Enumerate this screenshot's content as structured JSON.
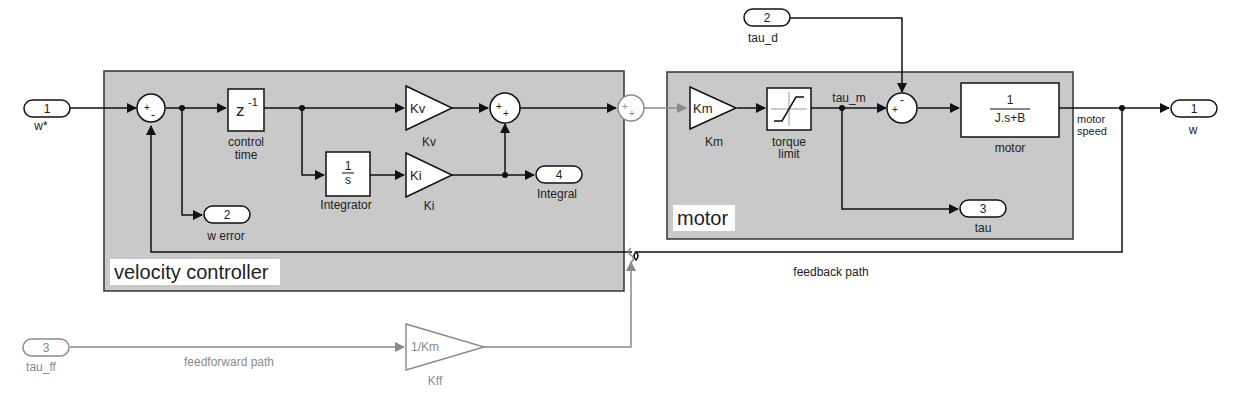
{
  "subsystems": {
    "velocity_controller": {
      "label": "velocity controller"
    },
    "motor": {
      "label": "motor"
    }
  },
  "inports": [
    {
      "num": "1",
      "label": "w*"
    },
    {
      "num": "2",
      "label": "tau_d"
    },
    {
      "num": "3",
      "label": "tau_ff"
    }
  ],
  "outports": [
    {
      "num": "1",
      "label": "w"
    },
    {
      "num": "2",
      "label": "w error"
    },
    {
      "num": "3",
      "label": "tau"
    },
    {
      "num": "4",
      "label": "Integral"
    }
  ],
  "blocks": {
    "delay": {
      "text": "z",
      "sup": "-1",
      "label1": "control",
      "label2": "time"
    },
    "integrator": {
      "num": "1",
      "den": "s",
      "label": "Integrator"
    },
    "kv": {
      "text": "Kv",
      "label": "Kv"
    },
    "ki": {
      "text": "Ki",
      "label": "Ki"
    },
    "km": {
      "text": "Km",
      "label": "Km"
    },
    "kff": {
      "text": "1/Km",
      "label": "Kff"
    },
    "torque_limit": {
      "label1": "torque",
      "label2": "limit"
    },
    "motor_tf": {
      "num": "1",
      "den": "J.s+B",
      "label": "motor"
    }
  },
  "sums": {
    "error_sum": {
      "signs": [
        "+",
        "-"
      ]
    },
    "pi_sum": {
      "signs": [
        "+",
        "+"
      ]
    },
    "ff_sum": {
      "signs": [
        "+",
        "+"
      ]
    },
    "torque_sum": {
      "signs": [
        "+",
        "-"
      ]
    }
  },
  "signals": {
    "tau_m": "tau_m",
    "motor_speed1": "motor",
    "motor_speed2": "speed",
    "feedback": "feedback path",
    "feedforward": "feedforward path"
  },
  "colors": {
    "subsystem_fill": "#c9c9c9",
    "line": "#111111",
    "feedforward": "#8a8a8a"
  }
}
